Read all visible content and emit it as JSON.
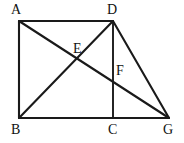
{
  "figure": {
    "type": "plane-geometry-diagram",
    "canvas": {
      "width": 184,
      "height": 143,
      "background": "#ffffff"
    },
    "stroke_color": "#1a1a1a",
    "label_color": "#111111",
    "points": [
      {
        "id": "A",
        "label": "A",
        "x": 19,
        "y": 21,
        "label_x": 11,
        "label_y": 3,
        "kind": "vertex"
      },
      {
        "id": "D",
        "label": "D",
        "x": 113,
        "y": 21,
        "label_x": 107,
        "label_y": 3,
        "kind": "vertex"
      },
      {
        "id": "B",
        "label": "B",
        "x": 19,
        "y": 118,
        "label_x": 11,
        "label_y": 123,
        "kind": "vertex"
      },
      {
        "id": "C",
        "label": "C",
        "x": 113,
        "y": 118,
        "label_x": 108,
        "label_y": 123,
        "kind": "vertex"
      },
      {
        "id": "G",
        "label": "G",
        "x": 169,
        "y": 118,
        "label_x": 163,
        "label_y": 123,
        "kind": "vertex"
      },
      {
        "id": "E",
        "label": "E",
        "x": 79,
        "y": 60,
        "label_x": 73,
        "label_y": 42,
        "kind": "intersection"
      },
      {
        "id": "F",
        "label": "F",
        "x": 113,
        "y": 79,
        "label_x": 116,
        "label_y": 64,
        "kind": "intersection"
      }
    ],
    "segments": [
      {
        "id": "AD",
        "from": "A",
        "to": "D",
        "role": "top-side"
      },
      {
        "id": "AB",
        "from": "A",
        "to": "B",
        "role": "left-side"
      },
      {
        "id": "BG",
        "from": "B",
        "to": "G",
        "role": "bottom-side"
      },
      {
        "id": "DG",
        "from": "D",
        "to": "G",
        "role": "right-slant-side"
      },
      {
        "id": "DC",
        "from": "D",
        "to": "C",
        "role": "vertical-altitude"
      },
      {
        "id": "BD",
        "from": "B",
        "to": "D",
        "role": "diagonal"
      },
      {
        "id": "AG",
        "from": "A",
        "to": "G",
        "role": "diagonal"
      }
    ]
  }
}
